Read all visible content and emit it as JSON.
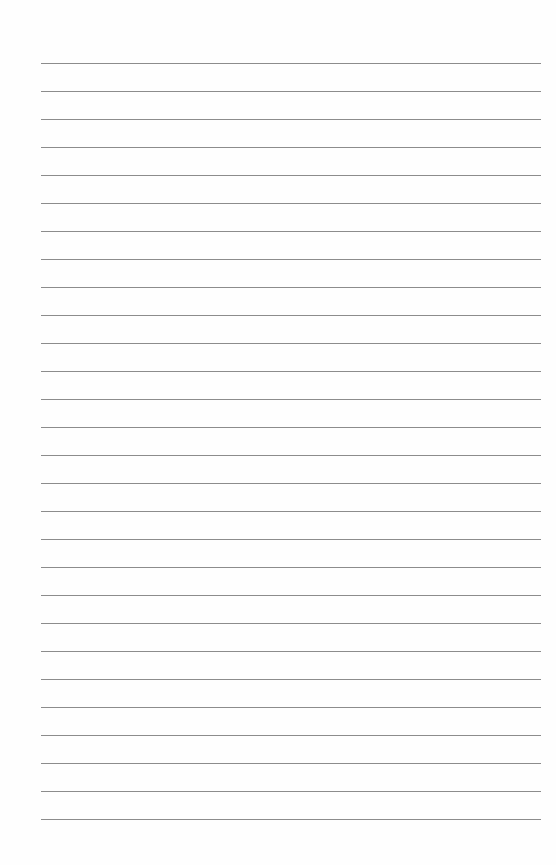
{
  "page": {
    "type": "lined-paper",
    "background_color": "#fefefe",
    "line_color": "#8c8c8c",
    "line_count": 28,
    "first_line_y": 63,
    "line_spacing": 28,
    "line_left": 41,
    "line_right": 541,
    "text": []
  }
}
